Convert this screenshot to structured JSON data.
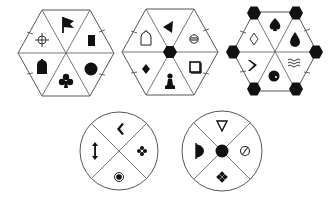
{
  "title": "Hexagon and circle symbol puzzle",
  "colors": {
    "background": "#ffffff",
    "line": "#555555",
    "symbol": "#111111"
  },
  "hexagons": [
    {
      "id": "hex-1",
      "center_marker": "none",
      "vertex_markers": "none",
      "segments": [
        {
          "position": "top",
          "symbol": "flag"
        },
        {
          "position": "upper-right",
          "symbol": "filled-rectangle"
        },
        {
          "position": "lower-right",
          "symbol": "filled-circle"
        },
        {
          "position": "bottom",
          "symbol": "club"
        },
        {
          "position": "lower-left",
          "symbol": "filled-tombstone"
        },
        {
          "position": "upper-left",
          "symbol": "crosshair"
        }
      ]
    },
    {
      "id": "hex-2",
      "center_marker": "filled-hexagon",
      "vertex_markers": "none",
      "segments": [
        {
          "position": "top",
          "symbol": "left-pointing-filled-triangle"
        },
        {
          "position": "upper-right",
          "symbol": "circle-with-horizontal-line"
        },
        {
          "position": "lower-right",
          "symbol": "open-square"
        },
        {
          "position": "bottom",
          "symbol": "chess-pawn"
        },
        {
          "position": "lower-left",
          "symbol": "filled-diamond"
        },
        {
          "position": "upper-left",
          "symbol": "open-tombstone"
        }
      ]
    },
    {
      "id": "hex-3",
      "center_marker": "none",
      "vertex_markers": "filled-hexagon",
      "segments": [
        {
          "position": "top",
          "symbol": "spade"
        },
        {
          "position": "upper-right",
          "symbol": "drop"
        },
        {
          "position": "lower-right",
          "symbol": "waves"
        },
        {
          "position": "bottom",
          "symbol": "filled-circle-with-dot"
        },
        {
          "position": "lower-left",
          "symbol": "right-chevron"
        },
        {
          "position": "upper-left",
          "symbol": "open-diamond"
        }
      ]
    }
  ],
  "circles": [
    {
      "id": "circle-1",
      "center_marker": "none",
      "segments": [
        {
          "position": "top",
          "symbol": "left-chevron"
        },
        {
          "position": "right",
          "symbol": "four-dot-flower"
        },
        {
          "position": "bottom",
          "symbol": "bullseye"
        },
        {
          "position": "left",
          "symbol": "up-down-arrow"
        }
      ]
    },
    {
      "id": "circle-2",
      "center_marker": "filled-circle",
      "segments": [
        {
          "position": "top",
          "symbol": "open-down-triangle"
        },
        {
          "position": "right",
          "symbol": "circle-slash"
        },
        {
          "position": "bottom",
          "symbol": "four-dot-diamond-cluster"
        },
        {
          "position": "left",
          "symbol": "half-filled-d"
        }
      ]
    }
  ],
  "glyphs": {
    "flag": "⚑",
    "club": "♣",
    "spade": "♠",
    "waves": "≈",
    "up_down_arrow": "↕",
    "left_chevron": "‹",
    "right_chevron": "›",
    "circle_slash": "⊘",
    "circle_line": "⊖",
    "pawn": "♟"
  }
}
